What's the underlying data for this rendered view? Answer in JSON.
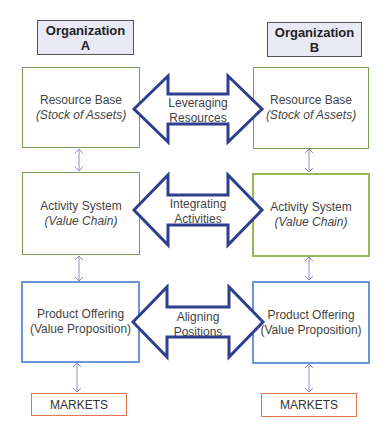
{
  "organizations": [
    {
      "label_line1": "Organization",
      "label_line2": "A"
    },
    {
      "label_line1": "Organization",
      "label_line2": "B"
    }
  ],
  "levels": [
    {
      "title": "Resource Base",
      "subtitle": "(Stock of Assets)",
      "link_line1": "Leveraging",
      "link_line2": "Resources"
    },
    {
      "title": "Activity System",
      "subtitle": "(Value Chain)",
      "link_line1": "Integrating",
      "link_line2": "Activities"
    },
    {
      "title": "Product Offering",
      "subtitle": "(Value Proposition)",
      "link_line1": "Aligning",
      "link_line2": "Positions"
    }
  ],
  "markets": {
    "label": "MARKETS"
  },
  "colors": {
    "org_fill": "#e9e9f6",
    "resource_border": "#7aa05a",
    "activity_border_b": "#95b85a",
    "product_border": "#6a95d6",
    "markets_border": "#e2754f",
    "big_arrow": "#2e3f8f",
    "small_arrow": "#8a8ac8"
  }
}
